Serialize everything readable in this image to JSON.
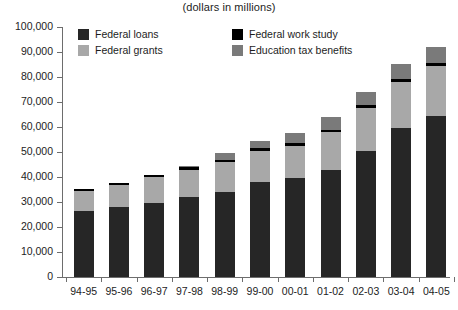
{
  "chart_data": {
    "type": "bar",
    "subtype": "stacked-vertical",
    "title": "",
    "subtitle": "(dollars in millions)",
    "xlabel": "",
    "ylabel": "",
    "ylim": [
      0,
      100000
    ],
    "ytick_values": [
      0,
      10000,
      20000,
      30000,
      40000,
      50000,
      60000,
      70000,
      80000,
      90000,
      100000
    ],
    "ytick_labels": [
      "0",
      "10,000",
      "20,000",
      "30,000",
      "40,000",
      "50,000",
      "60,000",
      "70,000",
      "80,000",
      "90,000",
      "100,000"
    ],
    "grid": false,
    "legend_position": "top-inside",
    "categories": [
      "94-95",
      "95-96",
      "96-97",
      "97-98",
      "98-99",
      "99-00",
      "00-01",
      "01-02",
      "02-03",
      "03-04",
      "04-05"
    ],
    "series": [
      {
        "name": "Federal loans",
        "color": "#262626",
        "values": [
          26500,
          28000,
          29500,
          32000,
          34000,
          38000,
          39500,
          43000,
          50500,
          59500,
          64500
        ]
      },
      {
        "name": "Federal grants",
        "color": "#a8a8a8",
        "values": [
          8000,
          9000,
          10500,
          11000,
          12000,
          12500,
          13000,
          15000,
          17000,
          18500,
          20000
        ]
      },
      {
        "name": "Federal work study",
        "color": "#000000",
        "values": [
          700,
          800,
          900,
          1000,
          1000,
          1000,
          1000,
          1000,
          1200,
          1200,
          1200
        ]
      },
      {
        "name": "Education tax benefits",
        "color": "#7a7a7a",
        "values": [
          0,
          0,
          0,
          500,
          2500,
          3000,
          4000,
          5000,
          5500,
          6000,
          6500
        ]
      }
    ],
    "totals": [
      35200,
      37800,
      40900,
      44500,
      49500,
      54500,
      57500,
      64000,
      74200,
      85200,
      92200
    ]
  },
  "legend": {
    "items": [
      {
        "label": "Federal loans",
        "color": "#262626"
      },
      {
        "label": "Federal grants",
        "color": "#a8a8a8"
      },
      {
        "label": "Federal work study",
        "color": "#000000"
      },
      {
        "label": "Education tax benefits",
        "color": "#7a7a7a"
      }
    ]
  }
}
